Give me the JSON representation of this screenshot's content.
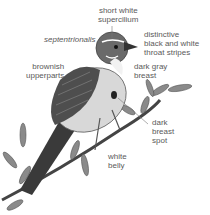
{
  "labels": {
    "supercilium": "short white\nsupercilium",
    "species": "septentrionalis",
    "throat": "distinctive\nblack and white\nthroat stripes",
    "upperparts": "brownish\nupperparts",
    "breast": "dark gray\nbreast",
    "breast_spot": "dark\nbreast\nspot",
    "belly": "white\nbelly"
  }
}
